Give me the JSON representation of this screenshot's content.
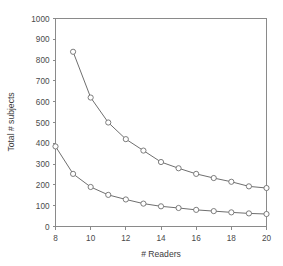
{
  "chart_data": {
    "type": "line",
    "title": "",
    "xlabel": "# Readers",
    "ylabel": "Total # subjects",
    "xlim": [
      8,
      20
    ],
    "ylim": [
      0,
      1000
    ],
    "xticks": [
      8,
      10,
      12,
      14,
      16,
      18,
      20
    ],
    "yticks": [
      0,
      100,
      200,
      300,
      400,
      500,
      600,
      700,
      800,
      900,
      1000
    ],
    "grid": false,
    "legend": null,
    "marker": "open-circle",
    "line_color": "#6f6f6f",
    "marker_fill": "#ffffff",
    "axis_color": "#8a8a8a",
    "background": "#ffffff",
    "series": [
      {
        "name": "upper-curve",
        "x": [
          9,
          10,
          11,
          12,
          13,
          14,
          15,
          16,
          17,
          18,
          19,
          20
        ],
        "values": [
          840,
          620,
          500,
          420,
          365,
          310,
          280,
          253,
          233,
          215,
          193,
          185
        ]
      },
      {
        "name": "lower-curve",
        "x": [
          8,
          9,
          10,
          11,
          12,
          13,
          14,
          15,
          16,
          17,
          18,
          19,
          20
        ],
        "values": [
          385,
          253,
          190,
          152,
          130,
          110,
          97,
          89,
          80,
          74,
          68,
          63,
          60
        ]
      }
    ]
  },
  "axes": {
    "x_tick_labels": [
      "8",
      "10",
      "12",
      "14",
      "16",
      "18",
      "20"
    ],
    "y_tick_labels": [
      "0",
      "100",
      "200",
      "300",
      "400",
      "500",
      "600",
      "700",
      "800",
      "900",
      "1000"
    ],
    "x_axis_title": "# Readers",
    "y_axis_title": "Total # subjects"
  }
}
